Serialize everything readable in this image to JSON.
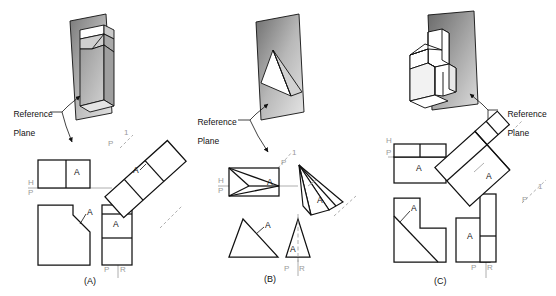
{
  "page": {
    "background": "#ffffff",
    "width": 556,
    "height": 296
  },
  "colors": {
    "line": "#111111",
    "axis_grey": "#9a9a9a",
    "plane_dark": "#6d6d6d",
    "plane_light": "#d8d8d8",
    "face_shade": "#b5b5b5",
    "white": "#ffffff"
  },
  "figures": [
    {
      "id": "A",
      "caption": "(A)",
      "reference_plane_label": "Reference\nPlane",
      "reference_plane_line1": "Reference",
      "reference_plane_line2": "Plane",
      "surface_label": "A",
      "fold_labels": {
        "horizontal": "H",
        "profile_top": "P",
        "profile_aux": "P",
        "auxiliary": "1",
        "profile_right": "P",
        "right": "R"
      },
      "views": {
        "top": "top view",
        "front": "front view",
        "right_side": "right side view",
        "auxiliary": "auxiliary view"
      },
      "surface_labels": {
        "top_view": "A",
        "front_view": "A",
        "right_view": "A",
        "aux_view": "A"
      },
      "pictorial_description": "Wedge-shaped block with inclined face against shaded reference plane"
    },
    {
      "id": "B",
      "caption": "(B)",
      "reference_plane_label": "Reference\nPlane",
      "reference_plane_line1": "Reference",
      "reference_plane_line2": "Plane",
      "surface_label": "A",
      "fold_labels": {
        "horizontal": "H",
        "profile_top": "P",
        "profile_aux": "P",
        "auxiliary": "1",
        "profile_right": "P",
        "right": "R"
      },
      "views": {
        "top": "top view",
        "front": "front view",
        "right_side": "right side view",
        "auxiliary": "auxiliary view"
      },
      "surface_labels": {
        "top_view": "A",
        "front_view": "A",
        "right_view": "A",
        "aux_view": "A"
      },
      "pictorial_description": "Triangular pyramid wedge against shaded reference plane"
    },
    {
      "id": "C",
      "caption": "(C)",
      "reference_plane_label": "Reference\nPlane",
      "reference_plane_line1": "Reference",
      "reference_plane_line2": "Plane",
      "surface_label": "A",
      "fold_labels": {
        "horizontal": "H",
        "profile_top": "P",
        "profile_aux": "P",
        "auxiliary": "1",
        "profile_right": "P",
        "right": "R"
      },
      "views": {
        "top": "top view",
        "front": "front view",
        "right_side": "right side view",
        "auxiliary": "auxiliary view"
      },
      "surface_labels": {
        "top_view": "A",
        "front_view": "A",
        "right_view": "A",
        "aux_view": "A"
      },
      "pictorial_description": "L-shaped block with inclined surface and rib against shaded reference plane"
    }
  ]
}
